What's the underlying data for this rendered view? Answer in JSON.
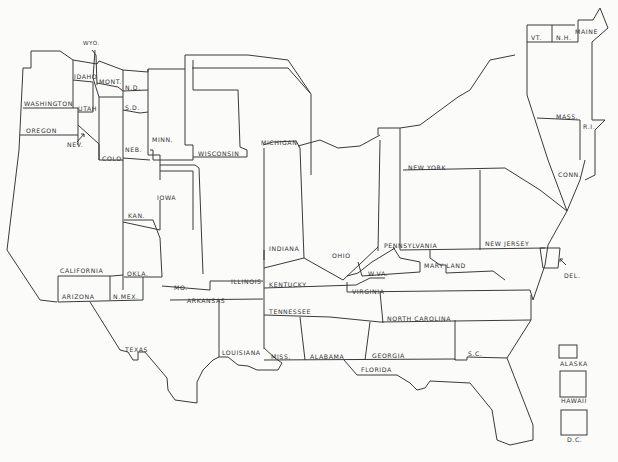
{
  "map": {
    "type": "cartogram",
    "subject": "United States (states sized non-geographically)",
    "states": {
      "wyo": "WYO.",
      "idaho": "IDAHO",
      "mont": "MONT.",
      "nd": "N.D.",
      "sd": "S.D.",
      "washington": "WASHINGTON",
      "utah": "UTAH",
      "oregon": "OREGON",
      "nev": "NEV.",
      "colo": "COLO.",
      "neb": "NEB.",
      "minn": "MINN.",
      "wisconsin": "WISCONSIN",
      "michigan": "MICHIGAN",
      "iowa": "IOWA",
      "kan": "KAN.",
      "california": "CALIFORNIA",
      "okla": "OKLA.",
      "arizona": "ARIZONA",
      "nmex": "N.MEX.",
      "mo": "MO.",
      "arkansas": "ARKANSAS",
      "illinois": "ILLINOIS",
      "indiana": "INDIANA",
      "ohio": "OHIO",
      "kentucky": "KENTUCKY",
      "wva": "W.VA.",
      "virginia": "VIRGINIA",
      "tennessee": "TENNESSEE",
      "north_carolina": "NORTH CAROLINA",
      "texas": "TEXAS",
      "louisiana": "LOUISIANA",
      "miss": "MISS.",
      "alabama": "ALABAMA",
      "georgia": "GEORGIA",
      "sc": "S.C.",
      "florida": "FLORIDA",
      "pennsylvania": "PENNSYLVANIA",
      "new_jersey": "NEW JERSEY",
      "maryland": "MARY LAND",
      "del": "DEL.",
      "new_york": "NEW YORK",
      "conn": "CONN.",
      "mass": "MASS.",
      "ri": "R.I.",
      "vt": "VT.",
      "nh": "N.H.",
      "maine": "MAINE"
    },
    "insets": {
      "alaska": "ALASKA",
      "hawaii": "HAWAII",
      "dc": "D.C."
    }
  }
}
